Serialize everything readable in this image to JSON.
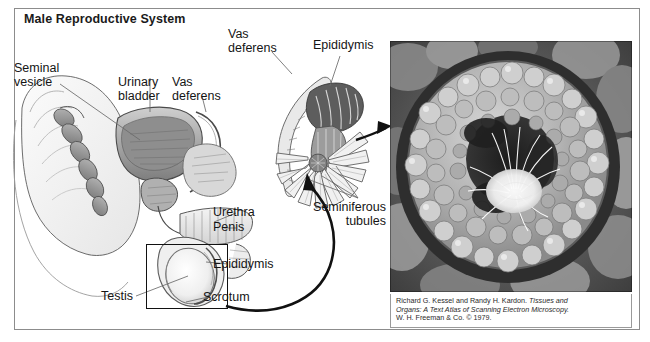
{
  "figure": {
    "title": "Male Reproductive System",
    "accent_line": "#111111",
    "label_color": "#151515",
    "frame_color": "#8c8c8c"
  },
  "labels": [
    {
      "id": "seminal-vesicle",
      "text": "Seminal\nvesicle"
    },
    {
      "id": "urinary-bladder",
      "text": "Urinary\nbladder"
    },
    {
      "id": "vas-deferens-left",
      "text": "Vas\ndeferens"
    },
    {
      "id": "vas-deferens-top",
      "text": "Vas\ndeferens"
    },
    {
      "id": "epididymis-top",
      "text": "Epididymis"
    },
    {
      "id": "urethra",
      "text": "Urethra"
    },
    {
      "id": "penis",
      "text": "Penis"
    },
    {
      "id": "epididymis-lower",
      "text": "Epididymis"
    },
    {
      "id": "testis",
      "text": "Testis"
    },
    {
      "id": "scrotum",
      "text": "Scrotum"
    },
    {
      "id": "seminiferous-tubules",
      "text": "Seminiferous\ntubules"
    }
  ],
  "micrograph": {
    "alt_name": "seminiferous-tubule-electron-micrograph",
    "credit_line_1_plain": "Richard G. Kessel and Randy H. Kardon. ",
    "credit_line_1_italic": "Tissues and",
    "credit_line_2_italic": "Organs: A Text Atlas of Scanning Electron Microscopy.",
    "credit_line_3_plain": "W. H. Freeman & Co. © 1979."
  }
}
